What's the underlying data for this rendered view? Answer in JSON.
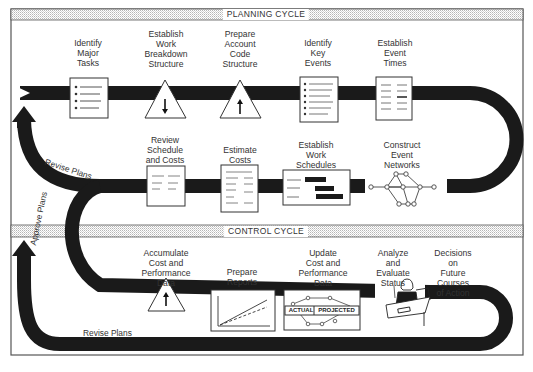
{
  "headers": {
    "planning": "PLANNING CYCLE",
    "control": "CONTROL CYCLE"
  },
  "planning_top_steps": [
    {
      "label": "Identify\nMajor\nTasks",
      "icon": "bulleted-list-document-icon"
    },
    {
      "label": "Establish\nWork\nBreakdown\nStructure",
      "icon": "triangle-down-arrow-icon"
    },
    {
      "label": "Prepare\nAccount\nCode\nStructure",
      "icon": "triangle-up-arrow-icon"
    },
    {
      "label": "Identify\nKey\nEvents",
      "icon": "bulleted-list-document-icon"
    },
    {
      "label": "Establish\nEvent\nTimes",
      "icon": "two-column-document-icon"
    }
  ],
  "planning_bottom_steps": [
    {
      "label": "Review\nSchedule\nand Costs",
      "icon": "document-icon"
    },
    {
      "label": "Estimate\nCosts",
      "icon": "document-icon"
    },
    {
      "label": "Establish\nWork\nSchedules",
      "icon": "gantt-chart-icon"
    },
    {
      "label": "Construct\nEvent\nNetworks",
      "icon": "network-graph-icon"
    }
  ],
  "control_steps": [
    {
      "label": "Accumulate\nCost and\nPerformance\nData",
      "icon": "triangle-up-arrow-icon"
    },
    {
      "label": "Prepare\nReports",
      "icon": "line-chart-icon"
    },
    {
      "label": "Update\nCost and\nPerformance\nData",
      "icon": "actual-projected-network-icon"
    },
    {
      "label": "Analyze\nand\nEvaluate\nStatus",
      "icon": "person-at-desk-icon"
    },
    {
      "label": "Decisions\non\nFuture\nCourses\nof Action",
      "icon": ""
    }
  ],
  "network_labels": {
    "actual": "ACTUAL",
    "projected": "PROJECTED"
  },
  "flow_labels": {
    "revise_upper": "Revise Plans",
    "approve": "Approve Plans",
    "revise_lower": "Revise Plans"
  },
  "colors": {
    "band": "#1a1a1a",
    "frame": "#555555",
    "hatch": "#c8c8c8",
    "text": "#333333"
  }
}
